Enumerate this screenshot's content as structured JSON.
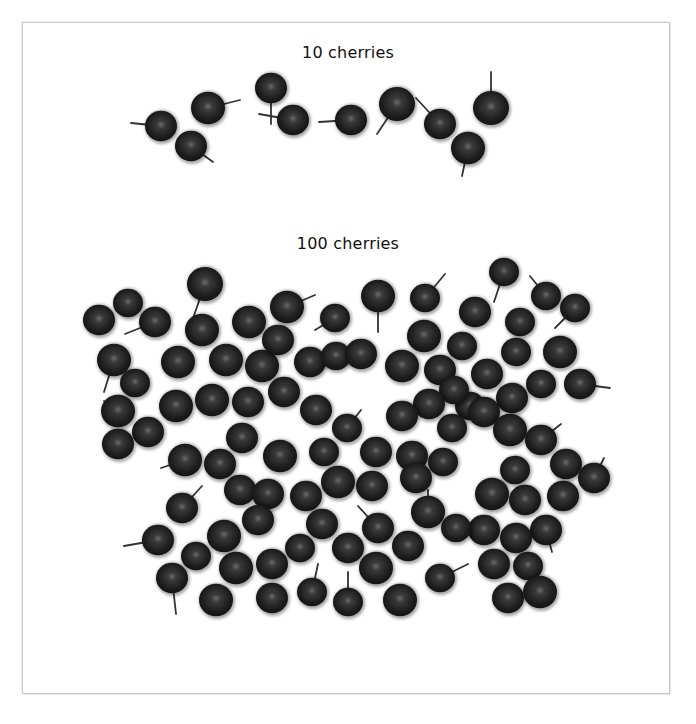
{
  "colors": {
    "background": "#ffffff",
    "frame": "#c9c9c9",
    "cherry_dark": "#141414",
    "cherry_mid": "#2e2e2e",
    "cherry_highlight": "#6a6a6a",
    "stem": "#333333",
    "text": "#111111"
  },
  "groups": [
    {
      "label": "10 cherries",
      "count": 10,
      "cherries": [
        {
          "x": 161,
          "y": 126,
          "r": 16,
          "sx": -30,
          "sy": -3
        },
        {
          "x": 208,
          "y": 108,
          "r": 17,
          "sx": 32,
          "sy": -8
        },
        {
          "x": 191,
          "y": 146,
          "r": 16,
          "sx": 22,
          "sy": 16
        },
        {
          "x": 271,
          "y": 88,
          "r": 16,
          "sx": 0,
          "sy": 36
        },
        {
          "x": 293,
          "y": 120,
          "r": 16,
          "sx": -34,
          "sy": -6
        },
        {
          "x": 351,
          "y": 120,
          "r": 16,
          "sx": -32,
          "sy": 2
        },
        {
          "x": 397,
          "y": 104,
          "r": 18,
          "sx": -20,
          "sy": 30
        },
        {
          "x": 440,
          "y": 124,
          "r": 16,
          "sx": -24,
          "sy": -26
        },
        {
          "x": 468,
          "y": 148,
          "r": 17,
          "sx": -6,
          "sy": 28
        },
        {
          "x": 491,
          "y": 108,
          "r": 18,
          "sx": 0,
          "sy": -36
        }
      ]
    },
    {
      "label": "100 cherries",
      "count": 100,
      "cherries": [
        {
          "x": 99,
          "y": 320,
          "r": 16,
          "sx": 0,
          "sy": 0
        },
        {
          "x": 128,
          "y": 303,
          "r": 15,
          "sx": 0,
          "sy": 0
        },
        {
          "x": 155,
          "y": 322,
          "r": 16,
          "sx": -30,
          "sy": 12
        },
        {
          "x": 205,
          "y": 284,
          "r": 18,
          "sx": -14,
          "sy": 40
        },
        {
          "x": 114,
          "y": 360,
          "r": 17,
          "sx": -10,
          "sy": 32
        },
        {
          "x": 135,
          "y": 383,
          "r": 15,
          "sx": 0,
          "sy": 0
        },
        {
          "x": 202,
          "y": 330,
          "r": 17,
          "sx": 0,
          "sy": 0
        },
        {
          "x": 178,
          "y": 362,
          "r": 17,
          "sx": 0,
          "sy": 0
        },
        {
          "x": 118,
          "y": 411,
          "r": 17,
          "sx": -14,
          "sy": -10
        },
        {
          "x": 148,
          "y": 432,
          "r": 16,
          "sx": 0,
          "sy": 0
        },
        {
          "x": 118,
          "y": 444,
          "r": 16,
          "sx": 0,
          "sy": 0
        },
        {
          "x": 249,
          "y": 322,
          "r": 17,
          "sx": 0,
          "sy": 0
        },
        {
          "x": 287,
          "y": 307,
          "r": 17,
          "sx": 28,
          "sy": -12
        },
        {
          "x": 335,
          "y": 318,
          "r": 15,
          "sx": -20,
          "sy": 12
        },
        {
          "x": 226,
          "y": 360,
          "r": 17,
          "sx": 0,
          "sy": 0
        },
        {
          "x": 262,
          "y": 366,
          "r": 17,
          "sx": 0,
          "sy": 0
        },
        {
          "x": 278,
          "y": 340,
          "r": 16,
          "sx": 0,
          "sy": 0
        },
        {
          "x": 310,
          "y": 362,
          "r": 16,
          "sx": 0,
          "sy": 0
        },
        {
          "x": 336,
          "y": 356,
          "r": 15,
          "sx": 0,
          "sy": 0
        },
        {
          "x": 361,
          "y": 354,
          "r": 16,
          "sx": 0,
          "sy": 0
        },
        {
          "x": 378,
          "y": 296,
          "r": 17,
          "sx": 0,
          "sy": 36
        },
        {
          "x": 425,
          "y": 298,
          "r": 15,
          "sx": 20,
          "sy": -24
        },
        {
          "x": 475,
          "y": 312,
          "r": 16,
          "sx": 0,
          "sy": 0
        },
        {
          "x": 504,
          "y": 272,
          "r": 15,
          "sx": -10,
          "sy": 30
        },
        {
          "x": 546,
          "y": 296,
          "r": 15,
          "sx": -16,
          "sy": -20
        },
        {
          "x": 575,
          "y": 308,
          "r": 15,
          "sx": -20,
          "sy": 20
        },
        {
          "x": 424,
          "y": 336,
          "r": 17,
          "sx": 0,
          "sy": 0
        },
        {
          "x": 462,
          "y": 346,
          "r": 15,
          "sx": 0,
          "sy": 0
        },
        {
          "x": 520,
          "y": 322,
          "r": 15,
          "sx": 0,
          "sy": 0
        },
        {
          "x": 402,
          "y": 366,
          "r": 17,
          "sx": 0,
          "sy": 0
        },
        {
          "x": 440,
          "y": 370,
          "r": 16,
          "sx": 0,
          "sy": 0
        },
        {
          "x": 487,
          "y": 374,
          "r": 16,
          "sx": 0,
          "sy": 0
        },
        {
          "x": 516,
          "y": 352,
          "r": 15,
          "sx": 0,
          "sy": 0
        },
        {
          "x": 560,
          "y": 352,
          "r": 17,
          "sx": 0,
          "sy": 0
        },
        {
          "x": 580,
          "y": 384,
          "r": 16,
          "sx": 30,
          "sy": 4
        },
        {
          "x": 541,
          "y": 384,
          "r": 15,
          "sx": 0,
          "sy": 0
        },
        {
          "x": 512,
          "y": 398,
          "r": 16,
          "sx": 0,
          "sy": 0
        },
        {
          "x": 470,
          "y": 406,
          "r": 15,
          "sx": 0,
          "sy": 0
        },
        {
          "x": 454,
          "y": 390,
          "r": 15,
          "sx": 0,
          "sy": 0
        },
        {
          "x": 429,
          "y": 404,
          "r": 16,
          "sx": 0,
          "sy": 0
        },
        {
          "x": 176,
          "y": 406,
          "r": 17,
          "sx": 0,
          "sy": 0
        },
        {
          "x": 212,
          "y": 400,
          "r": 17,
          "sx": 0,
          "sy": 0
        },
        {
          "x": 248,
          "y": 402,
          "r": 16,
          "sx": 0,
          "sy": 0
        },
        {
          "x": 284,
          "y": 392,
          "r": 16,
          "sx": 0,
          "sy": 0
        },
        {
          "x": 316,
          "y": 410,
          "r": 16,
          "sx": 0,
          "sy": 0
        },
        {
          "x": 347,
          "y": 428,
          "r": 15,
          "sx": 14,
          "sy": -18
        },
        {
          "x": 402,
          "y": 416,
          "r": 16,
          "sx": 0,
          "sy": 0
        },
        {
          "x": 452,
          "y": 428,
          "r": 15,
          "sx": 0,
          "sy": 0
        },
        {
          "x": 484,
          "y": 412,
          "r": 16,
          "sx": 0,
          "sy": 0
        },
        {
          "x": 510,
          "y": 430,
          "r": 17,
          "sx": 0,
          "sy": 0
        },
        {
          "x": 541,
          "y": 440,
          "r": 16,
          "sx": 20,
          "sy": -16
        },
        {
          "x": 185,
          "y": 460,
          "r": 17,
          "sx": -24,
          "sy": 8
        },
        {
          "x": 220,
          "y": 464,
          "r": 16,
          "sx": 0,
          "sy": 0
        },
        {
          "x": 242,
          "y": 438,
          "r": 16,
          "sx": 0,
          "sy": 0
        },
        {
          "x": 280,
          "y": 456,
          "r": 17,
          "sx": 0,
          "sy": 0
        },
        {
          "x": 324,
          "y": 452,
          "r": 15,
          "sx": 0,
          "sy": 0
        },
        {
          "x": 376,
          "y": 452,
          "r": 16,
          "sx": 0,
          "sy": 0
        },
        {
          "x": 412,
          "y": 456,
          "r": 16,
          "sx": 0,
          "sy": 0
        },
        {
          "x": 443,
          "y": 462,
          "r": 15,
          "sx": 0,
          "sy": 0
        },
        {
          "x": 515,
          "y": 470,
          "r": 15,
          "sx": 0,
          "sy": 0
        },
        {
          "x": 566,
          "y": 464,
          "r": 16,
          "sx": 0,
          "sy": 0
        },
        {
          "x": 594,
          "y": 478,
          "r": 16,
          "sx": 10,
          "sy": -20
        },
        {
          "x": 182,
          "y": 508,
          "r": 16,
          "sx": 20,
          "sy": -22
        },
        {
          "x": 240,
          "y": 490,
          "r": 16,
          "sx": 0,
          "sy": 0
        },
        {
          "x": 268,
          "y": 494,
          "r": 16,
          "sx": 0,
          "sy": 0
        },
        {
          "x": 306,
          "y": 496,
          "r": 16,
          "sx": 0,
          "sy": 0
        },
        {
          "x": 338,
          "y": 482,
          "r": 17,
          "sx": 0,
          "sy": 0
        },
        {
          "x": 372,
          "y": 486,
          "r": 16,
          "sx": 0,
          "sy": 0
        },
        {
          "x": 416,
          "y": 478,
          "r": 16,
          "sx": 0,
          "sy": 0
        },
        {
          "x": 428,
          "y": 512,
          "r": 17,
          "sx": 0,
          "sy": -22
        },
        {
          "x": 492,
          "y": 494,
          "r": 17,
          "sx": 0,
          "sy": 0
        },
        {
          "x": 525,
          "y": 500,
          "r": 16,
          "sx": 0,
          "sy": 0
        },
        {
          "x": 563,
          "y": 496,
          "r": 16,
          "sx": 0,
          "sy": 0
        },
        {
          "x": 546,
          "y": 530,
          "r": 16,
          "sx": 6,
          "sy": 22
        },
        {
          "x": 158,
          "y": 540,
          "r": 16,
          "sx": -34,
          "sy": 6
        },
        {
          "x": 224,
          "y": 536,
          "r": 17,
          "sx": 0,
          "sy": 0
        },
        {
          "x": 258,
          "y": 520,
          "r": 16,
          "sx": 0,
          "sy": 0
        },
        {
          "x": 322,
          "y": 524,
          "r": 16,
          "sx": 0,
          "sy": 0
        },
        {
          "x": 378,
          "y": 528,
          "r": 16,
          "sx": -20,
          "sy": -22
        },
        {
          "x": 408,
          "y": 546,
          "r": 16,
          "sx": 0,
          "sy": 0
        },
        {
          "x": 484,
          "y": 530,
          "r": 16,
          "sx": 0,
          "sy": 0
        },
        {
          "x": 516,
          "y": 538,
          "r": 16,
          "sx": 0,
          "sy": 0
        },
        {
          "x": 196,
          "y": 556,
          "r": 15,
          "sx": 0,
          "sy": 0
        },
        {
          "x": 236,
          "y": 568,
          "r": 17,
          "sx": 0,
          "sy": 0
        },
        {
          "x": 272,
          "y": 564,
          "r": 16,
          "sx": 0,
          "sy": 0
        },
        {
          "x": 300,
          "y": 548,
          "r": 15,
          "sx": 0,
          "sy": 0
        },
        {
          "x": 348,
          "y": 548,
          "r": 16,
          "sx": 0,
          "sy": 0
        },
        {
          "x": 376,
          "y": 568,
          "r": 17,
          "sx": 0,
          "sy": 0
        },
        {
          "x": 440,
          "y": 578,
          "r": 15,
          "sx": 28,
          "sy": -14
        },
        {
          "x": 494,
          "y": 564,
          "r": 16,
          "sx": 0,
          "sy": 0
        },
        {
          "x": 528,
          "y": 566,
          "r": 15,
          "sx": 0,
          "sy": 0
        },
        {
          "x": 172,
          "y": 578,
          "r": 16,
          "sx": 4,
          "sy": 36
        },
        {
          "x": 216,
          "y": 600,
          "r": 17,
          "sx": 0,
          "sy": 0
        },
        {
          "x": 272,
          "y": 598,
          "r": 16,
          "sx": 0,
          "sy": 0
        },
        {
          "x": 312,
          "y": 592,
          "r": 15,
          "sx": 6,
          "sy": -28
        },
        {
          "x": 348,
          "y": 602,
          "r": 15,
          "sx": 0,
          "sy": -30
        },
        {
          "x": 400,
          "y": 600,
          "r": 17,
          "sx": 0,
          "sy": 0
        },
        {
          "x": 508,
          "y": 598,
          "r": 16,
          "sx": 0,
          "sy": 0
        },
        {
          "x": 540,
          "y": 592,
          "r": 17,
          "sx": 0,
          "sy": 0
        },
        {
          "x": 456,
          "y": 528,
          "r": 15,
          "sx": 0,
          "sy": 0
        }
      ]
    }
  ]
}
